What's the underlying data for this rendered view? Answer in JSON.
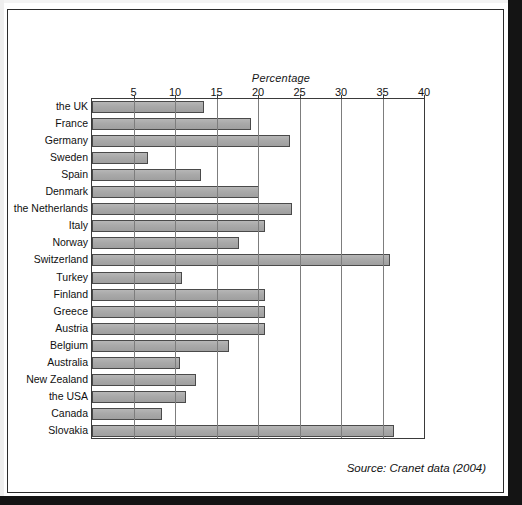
{
  "chart_data": {
    "type": "bar",
    "orientation": "horizontal",
    "title": "",
    "xlabel": "Percentage",
    "ylabel": "",
    "xlim": [
      0,
      40
    ],
    "xticks": [
      5,
      10,
      15,
      20,
      25,
      30,
      35,
      40
    ],
    "xtick_labels": [
      "5",
      "10",
      "15",
      "20",
      "25",
      "30",
      "35",
      "40"
    ],
    "grid": true,
    "legend": false,
    "categories": [
      "the UK",
      "France",
      "Germany",
      "Sweden",
      "Spain",
      "Denmark",
      "the Netherlands",
      "Italy",
      "Norway",
      "Switzerland",
      "Turkey",
      "Finland",
      "Greece",
      "Austria",
      "Belgium",
      "Australia",
      "New Zealand",
      "the USA",
      "Canada",
      "Slovakia"
    ],
    "values": [
      13.5,
      19.2,
      23.9,
      6.7,
      13.1,
      20.1,
      24.1,
      20.9,
      17.7,
      35.9,
      10.9,
      20.8,
      20.8,
      20.8,
      16.5,
      10.6,
      12.5,
      11.3,
      8.4,
      36.4
    ],
    "bar_color": "#a9a9a9",
    "bar_edge_color": "#4a4a4a",
    "source": "Source: Cranet data (2004)"
  },
  "axis": {
    "title": "Percentage",
    "ticks": [
      "5",
      "10",
      "15",
      "20",
      "25",
      "30",
      "35",
      "40"
    ]
  },
  "footer": {
    "source": "Source: Cranet data (2004)"
  }
}
